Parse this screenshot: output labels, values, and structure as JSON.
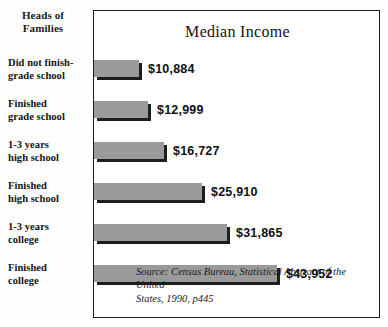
{
  "figure": {
    "side_heading": "Heads of\nFamilies",
    "side_heading_line1": "Heads of",
    "side_heading_line2": "Families",
    "title": "Median Income",
    "source_line1": "Source: Census Bureau, Statistical Abstract of the United",
    "source_line2": "States, 1990, p445",
    "bar_color": "#9a9a9a",
    "bar_shadow_color": "#1e1e1e",
    "frame_color": "#1b1b1b",
    "background_color": "#ffffff"
  },
  "chart_data": {
    "type": "bar",
    "orientation": "horizontal",
    "title": "Median Income",
    "xlabel": "",
    "ylabel": "Heads of Families",
    "grid": false,
    "legend": false,
    "xlim": [
      0,
      43952
    ],
    "categories": [
      "Did not finish-grade school",
      "Finished grade school",
      "1-3 years high school",
      "Finished high school",
      "1-3 years college",
      "Finished college"
    ],
    "category_lines": [
      [
        "Did not finish-",
        "grade school"
      ],
      [
        "Finished",
        "grade school"
      ],
      [
        "1-3 years",
        "high school"
      ],
      [
        "Finished",
        "high school"
      ],
      [
        "1-3 years",
        "college"
      ],
      [
        "Finished",
        "college"
      ]
    ],
    "values": [
      10884,
      12999,
      16727,
      25910,
      31865,
      43952
    ],
    "value_labels": [
      "$10,884",
      "$12,999",
      "$16,727",
      "$25,910",
      "$31,865",
      "$43,952"
    ],
    "source": "Source: Census Bureau, Statistical Abstract of the United States, 1990, p445"
  },
  "layout": {
    "label_tops": [
      55,
      96,
      137,
      178,
      219,
      260
    ],
    "bar_tops": [
      49,
      90,
      131,
      172,
      213,
      254
    ],
    "bar_widths": [
      92,
      108,
      139,
      215,
      265,
      183
    ]
  }
}
